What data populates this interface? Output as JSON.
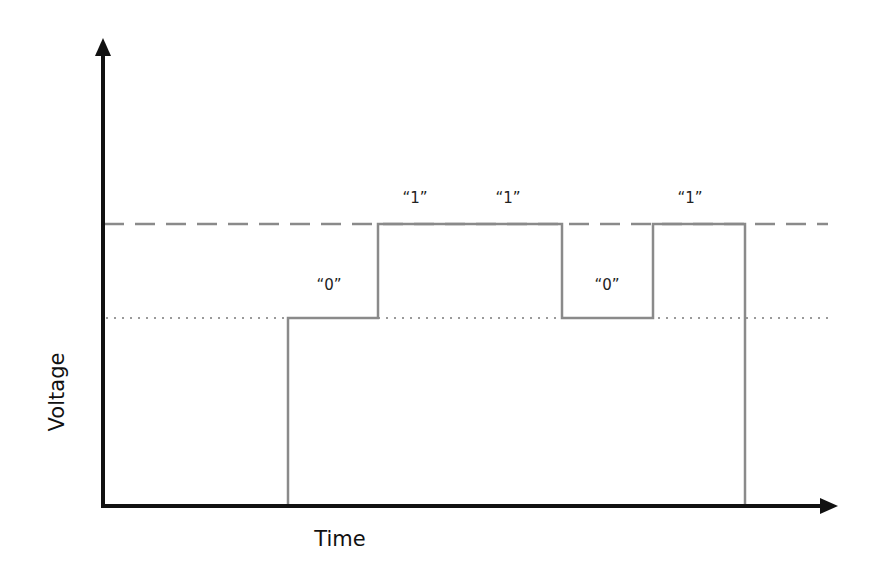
{
  "axes": {
    "x_label": "Time",
    "y_label": "Voltage"
  },
  "bits": [
    {
      "label": "“0”",
      "level": "low"
    },
    {
      "label": "“1”",
      "level": "high"
    },
    {
      "label": "“1”",
      "level": "high"
    },
    {
      "label": "“0”",
      "level": "low"
    },
    {
      "label": "“1”",
      "level": "high"
    }
  ],
  "reference_lines": {
    "high": "dashed",
    "low": "dotted"
  },
  "colors": {
    "axis": "#111111",
    "signal": "#8a8a8a",
    "reference": "#8a8a8a"
  }
}
